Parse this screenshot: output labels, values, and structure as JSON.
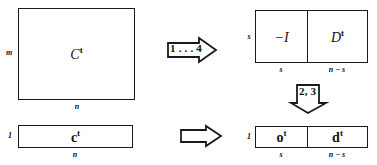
{
  "diagram": {
    "stroke_color": "#1a1a1a",
    "background_color": "#ffffff",
    "blocks": {
      "source_matrix": {
        "label": "C",
        "superscript": "t",
        "row_dim": "m",
        "col_dim": "n"
      },
      "source_vector": {
        "label": "c",
        "superscript": "t",
        "row_dim": "1",
        "col_dim": "n"
      },
      "result_matrix": {
        "row_dim": "s",
        "left_cell": {
          "label": "−I",
          "superscript": "",
          "col_dim": "s"
        },
        "right_cell": {
          "label": "D",
          "superscript": "t",
          "col_dim": "n − s"
        }
      },
      "result_vector": {
        "row_dim": "1",
        "left_cell": {
          "label": "o",
          "superscript": "t",
          "col_dim": "s"
        },
        "right_cell": {
          "label": "d",
          "superscript": "t",
          "col_dim": "n − s"
        }
      }
    },
    "arrows": {
      "top_right_arrow": {
        "label": "1 . . . 4",
        "direction": "right"
      },
      "down_arrow": {
        "label": "2, 3",
        "direction": "down"
      },
      "bottom_right_arrow": {
        "label": "",
        "direction": "right"
      }
    }
  }
}
